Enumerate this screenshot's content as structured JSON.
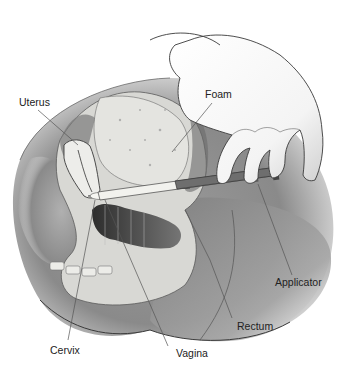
{
  "figure": {
    "labels": {
      "uterus": "Uterus",
      "foam": "Foam",
      "applicator": "Applicator",
      "rectum": "Rectum",
      "cervix": "Cervix",
      "vagina": "Vagina"
    },
    "colors": {
      "background": "#ffffff",
      "body_shade": "#8a8a8a",
      "tissue": "#d8d8d4",
      "outline": "#3a3a3a",
      "label_text": "#222222",
      "leader_line": "#555555"
    }
  }
}
